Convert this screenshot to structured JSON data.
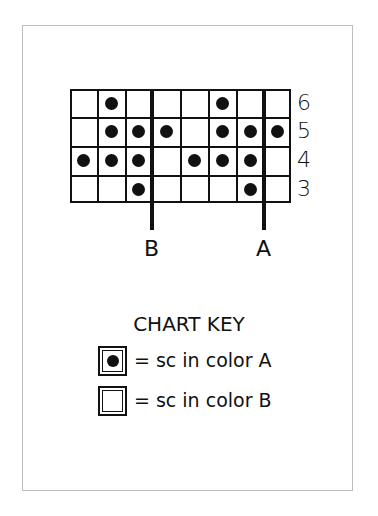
{
  "chart": {
    "columns": 8,
    "rows": [
      {
        "label": "6",
        "filled": [
          2,
          6
        ]
      },
      {
        "label": "5",
        "filled": [
          2,
          3,
          4,
          6,
          7,
          8
        ]
      },
      {
        "label": "4",
        "filled": [
          1,
          2,
          3,
          5,
          6,
          7
        ]
      },
      {
        "label": "3",
        "filled": [
          3,
          7
        ]
      }
    ],
    "guides": [
      {
        "label": "B",
        "after_column": 3
      },
      {
        "label": "A",
        "after_column": 7
      }
    ]
  },
  "key": {
    "title": "CHART KEY",
    "items": [
      {
        "symbol": "filled-dot",
        "text": "= sc in color A"
      },
      {
        "symbol": "empty-square",
        "text": "= sc in color B"
      }
    ]
  },
  "labels": {
    "row_6": "6",
    "row_5": "5",
    "row_4": "4",
    "row_3": "3",
    "guide_b": "B",
    "guide_a": "A"
  }
}
